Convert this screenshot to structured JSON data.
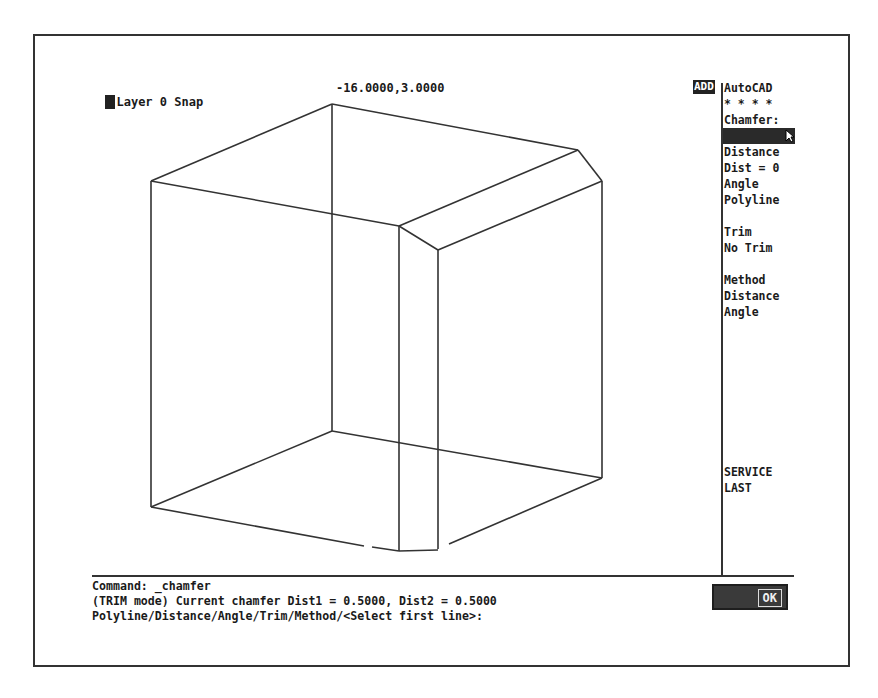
{
  "status_bar": {
    "layer_text": "Layer 0 Snap",
    "coordinates": "-16.0000,3.0000"
  },
  "side_menu": {
    "mode_tag": "ADD",
    "items": [
      {
        "label": "AutoCAD"
      },
      {
        "label": "* * * *"
      },
      {
        "label": "Chamfer:"
      },
      {
        "label": "",
        "selected": true
      },
      {
        "label": "Distance"
      },
      {
        "label": "Dist = 0"
      },
      {
        "label": "Angle"
      },
      {
        "label": "Polyline"
      },
      {
        "label": "Trim"
      },
      {
        "label": "No Trim"
      },
      {
        "label": "Method"
      },
      {
        "label": "Distance"
      },
      {
        "label": "Angle"
      },
      {
        "label": "SERVICE"
      },
      {
        "label": "LAST"
      }
    ]
  },
  "command_area": {
    "lines": [
      "Command: _chamfer",
      "(TRIM mode) Current chamfer Dist1 = 0.5000, Dist2 = 0.5000",
      "Polyline/Distance/Angle/Trim/Method/<Select first line>:"
    ]
  },
  "ok_button": {
    "label": "OK"
  },
  "colors": {
    "line": "#333333",
    "background": "#ffffff",
    "highlight": "#222222"
  }
}
